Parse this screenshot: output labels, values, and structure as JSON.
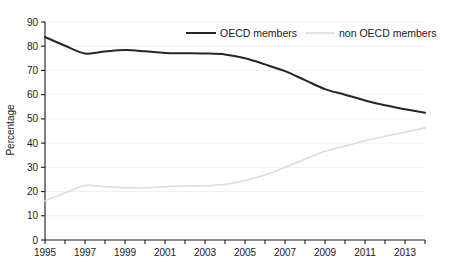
{
  "chart_data": {
    "type": "line",
    "title": "",
    "xlabel": "",
    "ylabel": "Percentage",
    "xlim": [
      1995,
      2014
    ],
    "ylim": [
      0,
      90
    ],
    "ytick_step": 10,
    "yticks": [
      0,
      10,
      20,
      30,
      40,
      50,
      60,
      70,
      80,
      90
    ],
    "ytick_labels": [
      "0",
      "10",
      "20",
      "30",
      "40",
      "50",
      "60",
      "70",
      "80",
      "90"
    ],
    "xticks": [
      1995,
      1996,
      1997,
      1998,
      1999,
      2000,
      2001,
      2002,
      2003,
      2004,
      2005,
      2006,
      2007,
      2008,
      2009,
      2010,
      2011,
      2012,
      2013,
      2014
    ],
    "xtick_labels_shown": [
      "1995",
      "1997",
      "1999",
      "2001",
      "2003",
      "2005",
      "2007",
      "2009",
      "2011",
      "2013"
    ],
    "xtick_label_years": [
      1995,
      1997,
      1999,
      2001,
      2003,
      2005,
      2007,
      2009,
      2011,
      2013
    ],
    "grid": "horizontal",
    "legend_position": "top-center",
    "x": [
      1995,
      1996,
      1997,
      1998,
      1999,
      2000,
      2001,
      2002,
      2003,
      2004,
      2005,
      2006,
      2007,
      2008,
      2009,
      2010,
      2011,
      2012,
      2013,
      2014
    ],
    "series": [
      {
        "name": "OECD members",
        "color": "#262626",
        "width": 2.0,
        "values": [
          83.8,
          80.2,
          77.0,
          77.8,
          78.4,
          77.9,
          77.2,
          77.1,
          77.0,
          76.6,
          75.0,
          72.5,
          69.7,
          66.0,
          62.3,
          60.0,
          57.6,
          55.6,
          54.0,
          52.5
        ]
      },
      {
        "name": "non OECD members",
        "color": "#dcdcdc",
        "width": 1.6,
        "values": [
          16.2,
          19.4,
          22.5,
          22.0,
          21.6,
          21.5,
          22.0,
          22.3,
          22.4,
          23.0,
          24.6,
          26.8,
          30.0,
          33.3,
          36.6,
          38.8,
          41.0,
          42.8,
          44.5,
          46.3
        ]
      }
    ]
  },
  "legend": {
    "items": [
      {
        "label": "OECD members",
        "color": "#262626"
      },
      {
        "label": "non OECD members",
        "color": "#dcdcdc"
      }
    ]
  },
  "axes": {
    "y_title": "Percentage"
  },
  "colors": {
    "axis": "#1a1a1a",
    "grid": "#f0f0f0",
    "background": "#ffffff",
    "oecd": "#262626",
    "non_oecd": "#dcdcdc"
  }
}
